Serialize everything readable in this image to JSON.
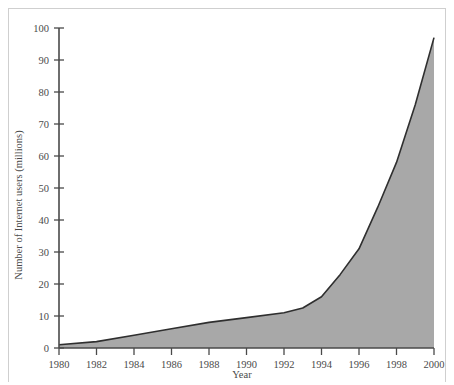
{
  "chart_data": {
    "type": "area",
    "title": "",
    "xlabel": "Year",
    "ylabel": "Number of Internet users (millions)",
    "xlim": [
      1980,
      2000
    ],
    "ylim": [
      0,
      100
    ],
    "xticks": [
      1980,
      1982,
      1984,
      1986,
      1988,
      1990,
      1992,
      1994,
      1996,
      1998,
      2000
    ],
    "xtick_labels": [
      "1980",
      "1982",
      "1984",
      "1986",
      "1988",
      "1990",
      "1992",
      "1994",
      "1996",
      "1998",
      "2000"
    ],
    "yticks": [
      0,
      10,
      20,
      30,
      40,
      50,
      60,
      70,
      80,
      90,
      100
    ],
    "ytick_labels": [
      "0",
      "10",
      "20",
      "30",
      "40",
      "50",
      "60",
      "70",
      "80",
      "90",
      "100"
    ],
    "grid": false,
    "legend": false,
    "fill_color": "#a8a8a8",
    "line_color": "#2f2f2f",
    "axis_color": "#4a4a4a",
    "series": [
      {
        "name": "Number of Internet users (millions)",
        "x": [
          1980,
          1982,
          1984,
          1986,
          1988,
          1990,
          1992,
          1993,
          1994,
          1995,
          1996,
          1997,
          1998,
          1999,
          2000
        ],
        "values": [
          1,
          2,
          4,
          6,
          8,
          9.5,
          11,
          12.5,
          16,
          23,
          31,
          44,
          58,
          76,
          97
        ]
      }
    ]
  },
  "axis_labels": {
    "x_title": "Year",
    "y_title": "Number of Internet users (millions)"
  }
}
